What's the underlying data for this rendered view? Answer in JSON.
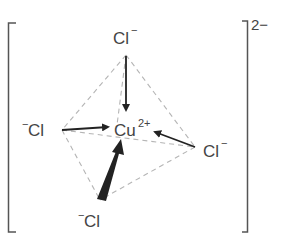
{
  "diagram": {
    "overall_charge": "2−",
    "center": {
      "symbol": "Cu",
      "charge": "2+"
    },
    "ligands": [
      {
        "position": "top",
        "symbol": "Cl",
        "charge": "−"
      },
      {
        "position": "left",
        "symbol": "Cl",
        "charge": "−"
      },
      {
        "position": "right",
        "symbol": "Cl",
        "charge": "−"
      },
      {
        "position": "bottom",
        "symbol": "Cl",
        "charge": "−"
      }
    ],
    "colors": {
      "text": "#444444",
      "bonds": "#222222",
      "dashes": "#b0b0b0",
      "bracket": "#555555"
    }
  }
}
